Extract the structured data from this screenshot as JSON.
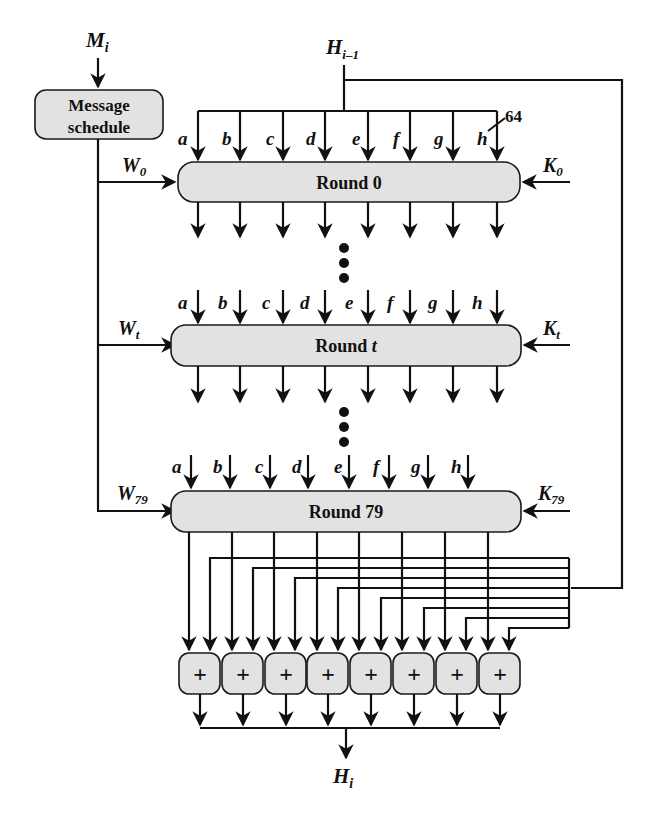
{
  "diagram": {
    "message_input": {
      "symbol": "M",
      "sub": "i"
    },
    "prev_hash": {
      "symbol": "H",
      "sub": "i–1"
    },
    "output_hash": {
      "symbol": "H",
      "sub": "i"
    },
    "message_schedule": {
      "line1": "Message",
      "line2": "schedule"
    },
    "bus_width": "64",
    "registers": [
      "a",
      "b",
      "c",
      "d",
      "e",
      "f",
      "g",
      "h"
    ],
    "rounds": [
      {
        "label": "Round 0",
        "label_main": "Round ",
        "label_var": "0",
        "w": {
          "symbol": "W",
          "sub": "0"
        },
        "k": {
          "symbol": "K",
          "sub": "0"
        }
      },
      {
        "label": "Round t",
        "label_main": "Round ",
        "label_var": "t",
        "w": {
          "symbol": "W",
          "sub": "t"
        },
        "k": {
          "symbol": "K",
          "sub": "t"
        }
      },
      {
        "label": "Round 79",
        "label_main": "Round ",
        "label_var": "79",
        "w": {
          "symbol": "W",
          "sub": "79"
        },
        "k": {
          "symbol": "K",
          "sub": "79"
        }
      }
    ],
    "ellipsis": "• • •",
    "adders": [
      "+",
      "+",
      "+",
      "+",
      "+",
      "+",
      "+",
      "+"
    ]
  }
}
